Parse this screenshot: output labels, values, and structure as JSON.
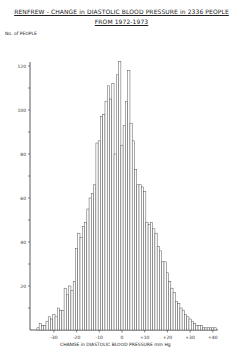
{
  "chart_data": {
    "type": "bar",
    "title": "RENFREW - CHANGE in DIASTOLIC BLOOD PRESSURE in 2336 PEOPLE",
    "subtitle": "FROM 1972-1973",
    "xlabel": "CHANGE in DIASTOLIC BLOOD PRESSURE mm Hg",
    "ylabel": "No. of PEOPLE",
    "x_ticks": [
      "-30",
      "-20",
      "-10",
      "0",
      "+10",
      "+20",
      "+30",
      "+40"
    ],
    "y_ticks": [
      "20",
      "40",
      "60",
      "80",
      "100",
      "120"
    ],
    "ylim": [
      0,
      125
    ],
    "xlim": [
      -38,
      42
    ],
    "grid": false,
    "categories": [
      -37,
      -36,
      -35,
      -34,
      -33,
      -32,
      -31,
      -30,
      -29,
      -28,
      -27,
      -26,
      -25,
      -24,
      -23,
      -22,
      -21,
      -20,
      -19,
      -18,
      -17,
      -16,
      -15,
      -14,
      -13,
      -12,
      -11,
      -10,
      -9,
      -8,
      -7,
      -6,
      -5,
      -4,
      -3,
      -2,
      -1,
      0,
      1,
      2,
      3,
      4,
      5,
      6,
      7,
      8,
      9,
      10,
      11,
      12,
      13,
      14,
      15,
      16,
      17,
      18,
      19,
      20,
      21,
      22,
      23,
      24,
      25,
      26,
      27,
      28,
      29,
      30,
      31,
      32,
      33,
      34,
      35,
      36,
      37,
      38,
      39,
      40,
      41
    ],
    "values": [
      1,
      3,
      2,
      2,
      4,
      6,
      5,
      7,
      6,
      10,
      9,
      9,
      19,
      16,
      20,
      18,
      22,
      37,
      44,
      42,
      47,
      49,
      55,
      60,
      62,
      66,
      85,
      86,
      97,
      98,
      104,
      111,
      105,
      112,
      80,
      116,
      122,
      84,
      93,
      104,
      118,
      94,
      86,
      73,
      66,
      66,
      65,
      63,
      49,
      48,
      49,
      46,
      44,
      38,
      36,
      31,
      31,
      26,
      22,
      19,
      17,
      13,
      12,
      10,
      9,
      7,
      6,
      5,
      4,
      3,
      2,
      2,
      2,
      1,
      1,
      1,
      1,
      1,
      1
    ]
  },
  "labels": {
    "title_line1": "RENFREW - CHANGE in DIASTOLIC BLOOD PRESSURE in 2336 PEOPLE",
    "title_line2": "FROM 1972-1973",
    "ylabel": "No. of PEOPLE",
    "xlabel": "CHANGE in DIASTOLIC BLOOD PRESSURE mm Hg"
  }
}
